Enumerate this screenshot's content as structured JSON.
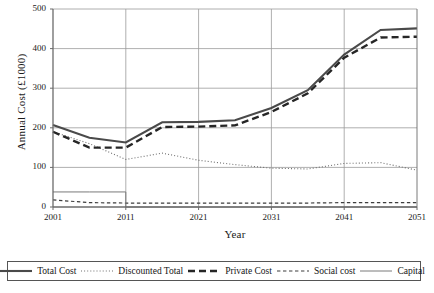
{
  "chart_data": {
    "type": "line",
    "title": "",
    "xlabel": "Year",
    "ylabel": "Annual Cost (£1000)",
    "xlim": [
      2001,
      2051
    ],
    "ylim": [
      0,
      500
    ],
    "xticks": [
      2001,
      2011,
      2021,
      2031,
      2041,
      2051
    ],
    "yticks": [
      0,
      100,
      200,
      300,
      400,
      500
    ],
    "grid": true,
    "legend_position": "bottom",
    "x": [
      2001,
      2006,
      2011,
      2016,
      2021,
      2026,
      2031,
      2036,
      2041,
      2046,
      2051
    ],
    "series": [
      {
        "name": "Total Cost",
        "style": "solid-thick",
        "color": "#4a4a4a",
        "values": [
          207,
          175,
          163,
          214,
          215,
          219,
          250,
          295,
          385,
          447,
          451
        ]
      },
      {
        "name": "Discounted Total",
        "style": "dotted",
        "color": "#6e6e6e",
        "values": [
          190,
          160,
          120,
          136,
          118,
          107,
          98,
          96,
          110,
          112,
          93
        ]
      },
      {
        "name": "Private Cost",
        "style": "dashed-thick",
        "color": "#262626",
        "values": [
          190,
          150,
          150,
          202,
          203,
          206,
          240,
          287,
          377,
          428,
          430
        ]
      },
      {
        "name": "Social cost",
        "style": "dash-dot-thin",
        "color": "#3d3d3d",
        "values": [
          18,
          11,
          10,
          10,
          10,
          10,
          10,
          10,
          11,
          11,
          11
        ]
      },
      {
        "name": "Capital",
        "style": "solid-thin",
        "color": "#7a7a7a",
        "values": [
          38,
          38,
          0,
          0,
          0,
          0,
          0,
          0,
          0,
          0,
          0
        ]
      }
    ]
  },
  "legend": {
    "items": [
      {
        "label": "Total Cost"
      },
      {
        "label": "Discounted Total"
      },
      {
        "label": "Private Cost"
      },
      {
        "label": "Social cost"
      },
      {
        "label": "Capital"
      }
    ]
  }
}
